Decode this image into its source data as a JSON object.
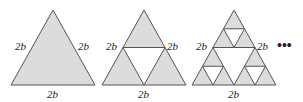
{
  "diagram": {
    "fill_color": "#dcdcdc",
    "stroke_color": "#555555",
    "stages": [
      {
        "name": "stage-0",
        "labels": {
          "left": "2b",
          "right": "2b",
          "bottom": "2b"
        }
      },
      {
        "name": "stage-1",
        "labels": {
          "left": "2b",
          "right": "2b",
          "bottom": "2b"
        }
      },
      {
        "name": "stage-2",
        "labels": {
          "left": "2b",
          "right": "2b",
          "bottom": "2b"
        }
      }
    ],
    "continuation": "•••"
  }
}
